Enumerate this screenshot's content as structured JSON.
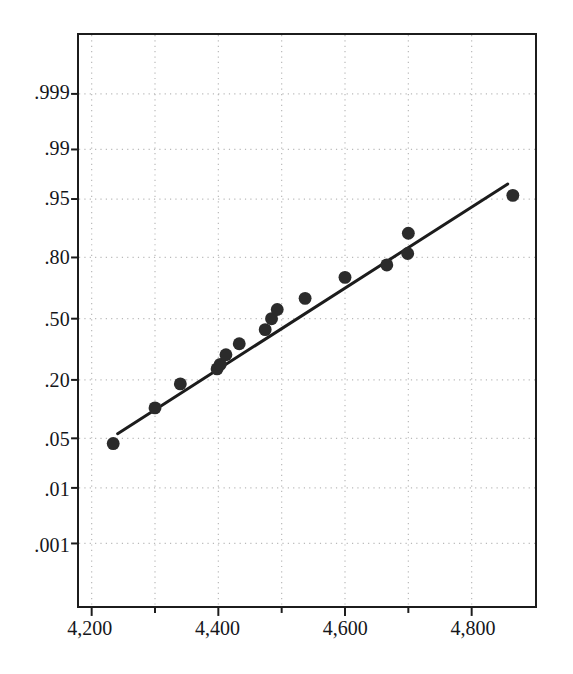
{
  "chart_data": {
    "type": "scatter",
    "title": "",
    "subtitle": "",
    "xlabel": "",
    "ylabel": "",
    "plot_kind": "normal-probability-plot",
    "grid": true,
    "legend": null,
    "xlim": [
      4180,
      4900
    ],
    "x_ticks_major": [
      4200,
      4400,
      4600,
      4800
    ],
    "x_tick_labels": [
      "4,200",
      "4,400",
      "4,600",
      "4,800"
    ],
    "x_ticks_minor": [
      4300,
      4500,
      4700
    ],
    "y_scale": "normal-probability",
    "y_ticks": [
      0.001,
      0.01,
      0.05,
      0.2,
      0.5,
      0.8,
      0.95,
      0.99,
      0.999
    ],
    "y_tick_labels": [
      ".001",
      ".01",
      ".05",
      ".20",
      ".50",
      ".80",
      ".95",
      ".99",
      ".999"
    ],
    "ylim_z": [
      -3.95,
      3.9
    ],
    "marker": {
      "shape": "circle",
      "color": "#2b2b2b",
      "size_px": 13
    },
    "points": [
      {
        "x": 4234,
        "p": 0.043
      },
      {
        "x": 4300,
        "p": 0.11
      },
      {
        "x": 4340,
        "p": 0.185
      },
      {
        "x": 4398,
        "p": 0.245
      },
      {
        "x": 4403,
        "p": 0.265
      },
      {
        "x": 4412,
        "p": 0.31
      },
      {
        "x": 4433,
        "p": 0.365
      },
      {
        "x": 4474,
        "p": 0.44
      },
      {
        "x": 4484,
        "p": 0.5
      },
      {
        "x": 4493,
        "p": 0.55
      },
      {
        "x": 4537,
        "p": 0.61
      },
      {
        "x": 4600,
        "p": 0.715
      },
      {
        "x": 4666,
        "p": 0.77
      },
      {
        "x": 4699,
        "p": 0.815
      },
      {
        "x": 4700,
        "p": 0.88
      },
      {
        "x": 4865,
        "p": 0.955
      }
    ],
    "fit_line": {
      "label": "reference line",
      "color": "#1c1c1c",
      "width_px": 3,
      "x_start": 4241,
      "p_start": 0.057,
      "x_end": 4857,
      "p_end": 0.968
    }
  },
  "axes": {
    "y_labels": [
      ".999",
      ".99",
      ".95",
      ".80",
      ".50",
      ".20",
      ".05",
      ".01",
      ".001"
    ],
    "x_labels": [
      "4,200",
      "4,400",
      "4,600",
      "4,800"
    ]
  },
  "style": {
    "grid_color": "#b9b9b9",
    "frame_color": "#1c1c1c",
    "text_color": "#15161a",
    "background": "#ffffff"
  }
}
